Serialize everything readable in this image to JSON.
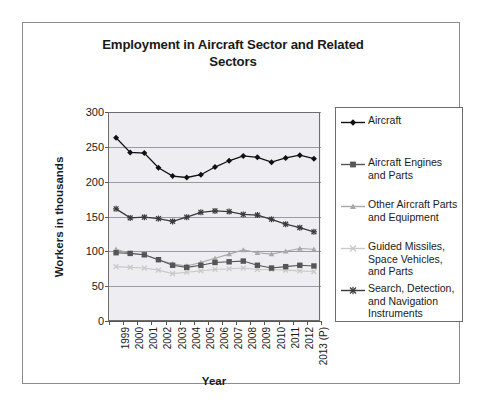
{
  "chart_data": {
    "type": "line",
    "title": "Employment in Aircraft Sector and Related Sectors",
    "title_line1": "Employment in Aircraft Sector and Related",
    "title_line2": "Sectors",
    "xlabel": "Year",
    "ylabel": "Workers in thousands",
    "ylim": [
      0,
      300
    ],
    "yticks": [
      0,
      50,
      100,
      150,
      200,
      250,
      300
    ],
    "grid": "horizontal",
    "legend_position": "right",
    "categories": [
      "1999",
      "2000",
      "2001",
      "2002",
      "2003",
      "2004",
      "2005",
      "2006",
      "2007",
      "2008",
      "2009",
      "2010",
      "2011",
      "2012",
      "2013 (P)"
    ],
    "series": [
      {
        "name": "Aircraft",
        "marker": "diamond",
        "color": "#111111",
        "values": [
          263,
          242,
          241,
          220,
          208,
          206,
          210,
          221,
          230,
          237,
          235,
          228,
          234,
          238,
          233
        ]
      },
      {
        "name": "Aircraft Engines and Parts",
        "marker": "square",
        "color": "#555555",
        "values": [
          98,
          97,
          95,
          88,
          80,
          77,
          80,
          84,
          85,
          86,
          80,
          76,
          78,
          80,
          79
        ]
      },
      {
        "name": "Other Aircraft Parts and Equipment",
        "marker": "triangle",
        "color": "#a8a8a8",
        "values": [
          103,
          97,
          95,
          88,
          82,
          79,
          84,
          90,
          96,
          102,
          98,
          96,
          100,
          104,
          103
        ]
      },
      {
        "name": "Guided Missiles, Space Vehicles, and Parts",
        "marker": "cross",
        "color": "#c9c9c9",
        "values": [
          78,
          77,
          76,
          73,
          68,
          70,
          72,
          74,
          75,
          76,
          74,
          74,
          73,
          72,
          71
        ]
      },
      {
        "name": "Search, Detection, and Navigation Instruments",
        "marker": "star",
        "color": "#3a3a3a",
        "values": [
          161,
          148,
          149,
          147,
          143,
          149,
          156,
          158,
          157,
          153,
          152,
          146,
          139,
          134,
          128
        ]
      }
    ]
  },
  "legend": {
    "items": [
      {
        "label_line1": "Aircraft",
        "label_line2": "",
        "label_line3": ""
      },
      {
        "label_line1": "Aircraft Engines",
        "label_line2": "and Parts",
        "label_line3": ""
      },
      {
        "label_line1": "Other Aircraft Parts",
        "label_line2": "and Equipment",
        "label_line3": ""
      },
      {
        "label_line1": "Guided Missiles,",
        "label_line2": "Space Vehicles,",
        "label_line3": "and Parts"
      },
      {
        "label_line1": "Search, Detection,",
        "label_line2": "and Navigation",
        "label_line3": "Instruments"
      }
    ]
  },
  "colors": {
    "plot_background": "#eeeef2",
    "gridline": "#9a9aa2",
    "axis": "#555555",
    "frame": "#8c8c8c",
    "text": "#1a1a1a"
  }
}
